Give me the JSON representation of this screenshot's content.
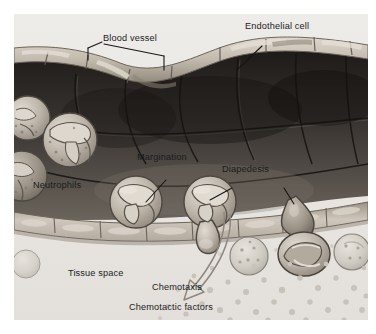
{
  "figure": {
    "type": "biological-illustration",
    "canvas": {
      "width": 376,
      "height": 334,
      "background": "#ffffff"
    },
    "plate": {
      "left": 14,
      "top": 14,
      "width": 354,
      "height": 306,
      "background": "#eceae6"
    }
  },
  "palette": {
    "paper": "#ffffff",
    "tissue_space": "#e9e7e3",
    "vessel_wall_light": "#cfc7bb",
    "vessel_wall_mid": "#a9a093",
    "lumen_dark": "#3b3834",
    "lumen_darkest": "#241f1c",
    "lumen_mid": "#5a534c",
    "cell_body": "#b9b1a6",
    "cell_highlight": "#ded8cf",
    "nucleus": "#cfc8bd",
    "outline": "#55504a",
    "leader_line": "#1b1b1b",
    "arrow_stroke": "#8d877e",
    "chemotactic_dot": "#c4c0b8",
    "label_text": "#1b1b1b"
  },
  "labels": [
    {
      "id": "blood-vessel",
      "text": "Blood vessel",
      "x": 103,
      "y": 38,
      "leader": "bracket-two-point"
    },
    {
      "id": "endothelial-cell",
      "text": "Endothelial cell",
      "x": 245,
      "y": 27,
      "leader": "diagonal-down-left"
    },
    {
      "id": "margination",
      "text": "Margination",
      "x": 137,
      "y": 158,
      "leader": "diagonal-down-left"
    },
    {
      "id": "diapedesis",
      "text": "Diapedesis",
      "x": 222,
      "y": 170,
      "leader": "two-sided"
    },
    {
      "id": "neutrophils",
      "text": "Neutrophils",
      "x": 33,
      "y": 186,
      "leader": "none"
    },
    {
      "id": "tissue-space",
      "text": "Tissue space",
      "x": 68,
      "y": 274,
      "leader": "none"
    },
    {
      "id": "chemotaxis",
      "text": "Chemotaxis",
      "x": 152,
      "y": 288,
      "leader": "none"
    },
    {
      "id": "chemotactic-factors",
      "text": "Chemotactic factors",
      "x": 129,
      "y": 308,
      "leader": "none"
    }
  ],
  "annotations": {
    "chemotaxis_arrow": {
      "name": "chemotaxis-arrow",
      "description": "curved outline arrow from the migrating neutrophil down-left into the chemotactic factor gradient",
      "style": "open outline, arrowhead at lower-left end"
    },
    "chemotactic_factor_field": {
      "name": "chemotactic-factor-dots",
      "description": "scattered small round dots forming a concentration gradient in the tissue space",
      "approx_count": 46
    }
  },
  "structures": [
    {
      "name": "vessel-lumen",
      "description": "dark interior of the blood vessel spanning the upper two thirds"
    },
    {
      "name": "upper-endothelium",
      "description": "row of elongated endothelial cells forming the top vessel wall"
    },
    {
      "name": "lower-endothelium",
      "description": "row of elongated endothelial cells forming the bottom vessel wall"
    },
    {
      "name": "circulating-neutrophil",
      "description": "round granulocyte with multilobed nucleus free in the lumen",
      "count": 4
    },
    {
      "name": "marginating-neutrophil",
      "description": "neutrophil adhered to the lower endothelial surface",
      "count": 2
    },
    {
      "name": "diapedesis-neutrophil",
      "description": "neutrophil squeezing a pseudopod between endothelial cells",
      "count": 2
    },
    {
      "name": "tissue-cell",
      "description": "rounded granular cell resting in the tissue space",
      "count": 3
    }
  ]
}
